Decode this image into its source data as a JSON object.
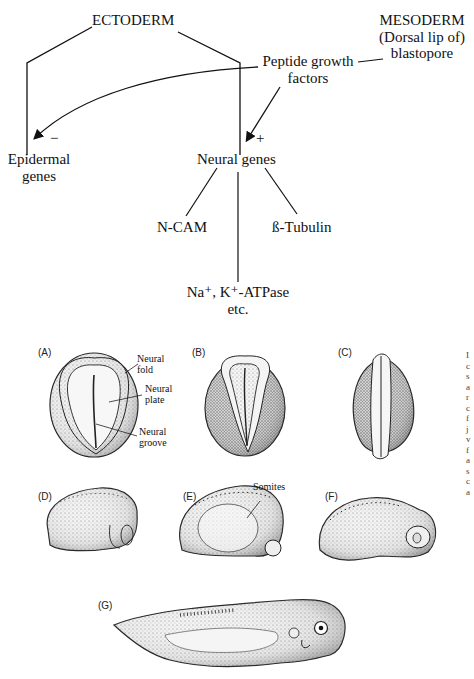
{
  "flowchart": {
    "nodes": {
      "ectoderm": "ECTODERM",
      "mesoderm_line1": "MESODERM",
      "mesoderm_line2": "(Dorsal lip of)",
      "mesoderm_line3": "blastopore",
      "peptide_line1": "Peptide growth",
      "peptide_line2": "factors",
      "epidermal_line1": "Epidermal",
      "epidermal_line2": "genes",
      "neural_genes": "Neural genes",
      "ncam": "N-CAM",
      "tubulin": "ß-Tubulin",
      "atpase_line1": "Na⁺, K⁺-ATPase",
      "atpase_line2": "etc."
    },
    "signs": {
      "inhibit": "−",
      "activate": "+"
    }
  },
  "embryo_panels": {
    "A": {
      "label": "(A)",
      "annotations": [
        "Neural fold",
        "Neural plate",
        "Neural groove"
      ]
    },
    "B": {
      "label": "(B)"
    },
    "C": {
      "label": "(C)"
    },
    "D": {
      "label": "(D)"
    },
    "E": {
      "label": "(E)",
      "annotations": [
        "Somites"
      ]
    },
    "F": {
      "label": "(F)"
    },
    "G": {
      "label": "(G)"
    }
  },
  "annotations": {
    "neural_fold_1": "Neural",
    "neural_fold_2": "fold",
    "neural_plate_1": "Neural",
    "neural_plate_2": "plate",
    "neural_groove_1": "Neural",
    "neural_groove_2": "groove",
    "somites": "Somites"
  }
}
